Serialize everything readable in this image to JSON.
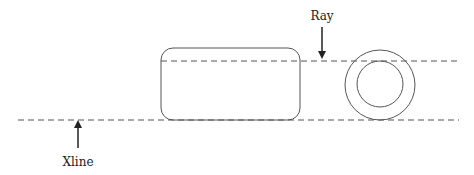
{
  "diagram": {
    "labels": {
      "ray": "Ray",
      "xline": "Xline"
    },
    "colors": {
      "stroke": "#555555",
      "arrow": "#222222",
      "background": "#ffffff"
    },
    "lines": [
      {
        "name": "xline",
        "type": "dashed",
        "y": 120,
        "x_start": 18,
        "x_end": 459
      },
      {
        "name": "ray",
        "type": "dashed",
        "y": 61,
        "x_start": 161,
        "x_end": 459
      }
    ],
    "shapes": [
      {
        "name": "rounded-rectangle",
        "x": 161,
        "y": 48,
        "width": 139,
        "height": 72,
        "corner_radius": 12
      },
      {
        "name": "outer-circle",
        "cx": 380,
        "cy": 85,
        "r": 35
      },
      {
        "name": "inner-circle",
        "cx": 380,
        "cy": 84,
        "r": 23
      }
    ],
    "arrows": [
      {
        "name": "ray-arrow",
        "x": 322,
        "from_y": 27,
        "to_y": 58,
        "direction": "down"
      },
      {
        "name": "xline-arrow",
        "x": 78,
        "from_y": 148,
        "to_y": 121,
        "direction": "up"
      }
    ]
  }
}
